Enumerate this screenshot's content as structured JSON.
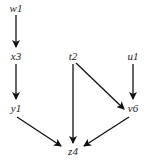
{
  "diagram": {
    "type": "directed-graph",
    "nodes": [
      {
        "id": "w1",
        "label": "w1",
        "x": 16,
        "y": 9
      },
      {
        "id": "x3",
        "label": "x3",
        "x": 16,
        "y": 57
      },
      {
        "id": "y1",
        "label": "y1",
        "x": 16,
        "y": 109
      },
      {
        "id": "t2",
        "label": "t2",
        "x": 73,
        "y": 57
      },
      {
        "id": "u1",
        "label": "u1",
        "x": 133,
        "y": 57
      },
      {
        "id": "v6",
        "label": "v6",
        "x": 133,
        "y": 109
      },
      {
        "id": "z4",
        "label": "z4",
        "x": 73,
        "y": 152
      }
    ],
    "edges": [
      {
        "from": "w1",
        "to": "x3"
      },
      {
        "from": "x3",
        "to": "y1"
      },
      {
        "from": "y1",
        "to": "z4"
      },
      {
        "from": "t2",
        "to": "z4"
      },
      {
        "from": "t2",
        "to": "v6"
      },
      {
        "from": "u1",
        "to": "v6"
      },
      {
        "from": "v6",
        "to": "z4"
      }
    ],
    "colors": {
      "edge": "#111111",
      "label": "#222222",
      "background": "#ffffff"
    }
  }
}
